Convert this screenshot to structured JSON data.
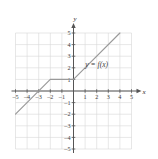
{
  "chart_data": {
    "type": "line",
    "title": "",
    "xlabel": "x",
    "ylabel": "y",
    "xlim": [
      -5,
      5
    ],
    "ylim": [
      -5,
      5
    ],
    "grid": true,
    "legend": "none",
    "annotations": [
      {
        "text": "y = f(x)",
        "x": 2.0,
        "y": 2.1
      }
    ],
    "xticks": [
      -5,
      -4,
      -3,
      -2,
      -1,
      1,
      2,
      3,
      4,
      5
    ],
    "yticks": [
      5,
      4,
      3,
      2,
      1,
      -1,
      -2,
      -3,
      -4,
      -5
    ],
    "xtick_labels": [
      "–5",
      "–4",
      "–3",
      "–2",
      "–1",
      "1",
      "2",
      "3",
      "4",
      "5"
    ],
    "ytick_labels": [
      "5",
      "4",
      "3",
      "2",
      "1",
      "–1",
      "–2",
      "–3",
      "–4",
      "–5"
    ],
    "series": [
      {
        "name": "f(x)",
        "points": [
          {
            "x": -5,
            "y": -2
          },
          {
            "x": -2,
            "y": 1
          },
          {
            "x": 0,
            "y": 1
          },
          {
            "x": 4,
            "y": 5
          }
        ]
      }
    ]
  },
  "axes": {
    "x_axis_label": "x",
    "y_axis_label": "y"
  },
  "function_label": "y = f(x)",
  "colors": {
    "curve": "#9a9a9a",
    "grid": "#d7d7d7",
    "axis": "#555555",
    "text": "#3a3a3a",
    "background": "#ffffff"
  }
}
